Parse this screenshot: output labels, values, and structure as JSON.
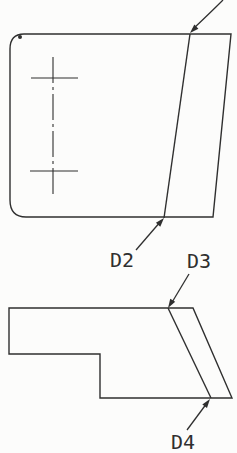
{
  "page": {
    "width": 237,
    "height": 453,
    "background": "#fcfcfb",
    "ink": "#2f2f2f"
  },
  "drawing": {
    "type": "engineering-orthographic-views",
    "description": "Two orthographic views of a plate with an angled bent flange; datum callouts D2, D3, D4 and one leader entering from off-screen top",
    "labels": {
      "d2": {
        "text": "D2",
        "x": 110,
        "baseline": 267
      },
      "d3": {
        "text": "D3",
        "x": 187,
        "baseline": 268
      },
      "d4": {
        "text": "D4",
        "x": 171,
        "baseline": 449
      }
    },
    "top_view": {
      "outline_path": "M 24 34 L 231 34 L 213 217 L 26 217 Q 10 217 10 200 L 10 49 Q 10 34 24 34 Z",
      "bend_line": {
        "x1": 190,
        "y1": 34,
        "x2": 164,
        "y2": 218
      },
      "centerline": {
        "x1": 53,
        "y1": 57,
        "x2": 53,
        "y2": 197,
        "dash": "26 4 3 4"
      },
      "center_marks": [
        {
          "x1": 31,
          "y1": 78,
          "x2": 78,
          "y2": 78
        },
        {
          "x1": 30,
          "y1": 171,
          "x2": 78,
          "y2": 171
        }
      ],
      "corner_blob": {
        "cx": 20,
        "cy": 37,
        "r": 2
      }
    },
    "side_view": {
      "outline_path": "M 9 308 L 193 308 L 232 398 L 100 398 L 100 354 L 9 354 Z",
      "bend_line": {
        "x1": 168,
        "y1": 308,
        "x2": 211,
        "y2": 398
      }
    },
    "leaders": [
      {
        "name": "leader-offscreen-top",
        "path": "M 223 0 Q 211 12 193 29",
        "tip": [
          190,
          33
        ],
        "angle": 135
      },
      {
        "name": "leader-d2",
        "path": "M 136 250 L 161 221",
        "tip": [
          164,
          218
        ],
        "angle": -48.8
      },
      {
        "name": "leader-d3",
        "path": "M 189 274 L 171 304",
        "tip": [
          168,
          308
        ],
        "angle": 121.7
      },
      {
        "name": "leader-d4",
        "path": "M 187 430 L 207 403",
        "tip": [
          210,
          399
        ],
        "angle": -53.4
      }
    ],
    "stroke_width": 1.4
  }
}
